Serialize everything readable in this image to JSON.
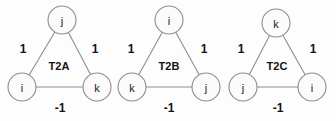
{
  "figure": {
    "background_color": "#fdfdfd",
    "node_fill": "#fbfbfb",
    "stroke_color": "#8d8d8d",
    "text_color": "#141414"
  },
  "triangles": [
    {
      "name": "T2A",
      "name_x": 59,
      "name_y": 66,
      "nodes": [
        {
          "id": "top",
          "label": "j",
          "cx": 62,
          "cy": 20,
          "r": 14
        },
        {
          "id": "left",
          "label": "i",
          "cx": 22,
          "cy": 87,
          "r": 14
        },
        {
          "id": "right",
          "label": "k",
          "cx": 97,
          "cy": 87,
          "r": 14
        }
      ],
      "edges": [
        {
          "id": "top-left",
          "from": "top",
          "to": "left",
          "weight": "1",
          "lx": 23,
          "ly": 49
        },
        {
          "id": "top-right",
          "from": "top",
          "to": "right",
          "weight": "1",
          "lx": 95,
          "ly": 49
        },
        {
          "id": "left-right",
          "from": "left",
          "to": "right",
          "weight": "-1",
          "lx": 60,
          "ly": 108
        }
      ]
    },
    {
      "name": "T2B",
      "name_x": 169,
      "name_y": 66,
      "nodes": [
        {
          "id": "top",
          "label": "i",
          "cx": 169,
          "cy": 20,
          "r": 14
        },
        {
          "id": "left",
          "label": "k",
          "cx": 132,
          "cy": 87,
          "r": 14
        },
        {
          "id": "right",
          "label": "j",
          "cx": 206,
          "cy": 87,
          "r": 14
        }
      ],
      "edges": [
        {
          "id": "top-left",
          "from": "top",
          "to": "left",
          "weight": "1",
          "lx": 131,
          "ly": 49
        },
        {
          "id": "top-right",
          "from": "top",
          "to": "right",
          "weight": "1",
          "lx": 204,
          "ly": 49
        },
        {
          "id": "left-right",
          "from": "left",
          "to": "right",
          "weight": "-1",
          "lx": 169,
          "ly": 108
        }
      ]
    },
    {
      "name": "T2C",
      "name_x": 277,
      "name_y": 66,
      "nodes": [
        {
          "id": "top",
          "label": "k",
          "cx": 276,
          "cy": 23,
          "r": 14
        },
        {
          "id": "left",
          "label": "j",
          "cx": 243,
          "cy": 87,
          "r": 14
        },
        {
          "id": "right",
          "label": "i",
          "cx": 312,
          "cy": 87,
          "r": 14
        }
      ],
      "edges": [
        {
          "id": "top-left",
          "from": "top",
          "to": "left",
          "weight": "1",
          "lx": 241,
          "ly": 49
        },
        {
          "id": "top-right",
          "from": "top",
          "to": "right",
          "weight": "1",
          "lx": 313,
          "ly": 49
        },
        {
          "id": "left-right",
          "from": "left",
          "to": "right",
          "weight": "-1",
          "lx": 278,
          "ly": 108
        }
      ]
    }
  ]
}
